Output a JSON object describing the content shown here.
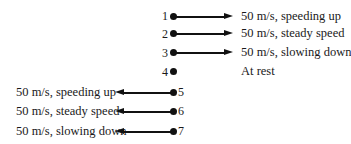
{
  "diagram": {
    "title": "",
    "dots": [
      {
        "number": "1",
        "label": "50 m/s, speeding up",
        "direction": "right"
      },
      {
        "number": "2",
        "label": "50 m/s, steady speed",
        "direction": "right"
      },
      {
        "number": "3",
        "label": "50 m/s, slowing down",
        "direction": "right"
      },
      {
        "number": "4",
        "label": "At rest",
        "direction": "none"
      },
      {
        "number": "5",
        "label": "50 m/s, speeding up",
        "direction": "left"
      },
      {
        "number": "6",
        "label": "50 m/s, steady speed",
        "direction": "left"
      },
      {
        "number": "7",
        "label": "50 m/s, slowing down",
        "direction": "left"
      }
    ],
    "colors": {
      "ink": "#111111",
      "background": "#ffffff"
    }
  }
}
